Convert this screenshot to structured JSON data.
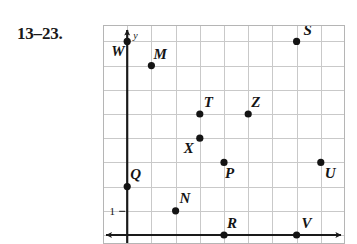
{
  "exercise": {
    "label": "13–23."
  },
  "figure": {
    "axis_labels": {
      "y": "y"
    },
    "tick_labels": {
      "one": "1"
    },
    "colors": {
      "grid_line": "#c9c9c9",
      "axis": "#1a1a1a",
      "point": "#141414",
      "text": "#141414",
      "background": "#ffffff",
      "frame": "#b5b5b5"
    }
  },
  "chart_data": {
    "type": "scatter",
    "title": "",
    "xlabel": "",
    "ylabel": "y",
    "xlim": [
      -1,
      9
    ],
    "ylim": [
      0,
      9
    ],
    "grid": true,
    "legend": "none",
    "tick_labels": {
      "y": [
        "1"
      ]
    },
    "points": [
      {
        "name": "W",
        "x": 0,
        "y": 8,
        "label_dx": -16,
        "label_dy": 15
      },
      {
        "name": "S",
        "x": 7,
        "y": 8,
        "label_dx": 7,
        "label_dy": -6
      },
      {
        "name": "M",
        "x": 1,
        "y": 7,
        "label_dx": 2,
        "label_dy": -7
      },
      {
        "name": "T",
        "x": 3,
        "y": 5,
        "label_dx": 4,
        "label_dy": -7
      },
      {
        "name": "Z",
        "x": 5,
        "y": 5,
        "label_dx": 3,
        "label_dy": -7
      },
      {
        "name": "X",
        "x": 3,
        "y": 4,
        "label_dx": -16,
        "label_dy": 15
      },
      {
        "name": "P",
        "x": 4,
        "y": 3,
        "label_dx": 1,
        "label_dy": 16
      },
      {
        "name": "U",
        "x": 8,
        "y": 3,
        "label_dx": 4,
        "label_dy": 16
      },
      {
        "name": "Q",
        "x": 0,
        "y": 2,
        "label_dx": 3,
        "label_dy": -8
      },
      {
        "name": "N",
        "x": 2,
        "y": 1,
        "label_dx": 4,
        "label_dy": -8
      },
      {
        "name": "R",
        "x": 4,
        "y": 0,
        "label_dx": 3,
        "label_dy": -7
      },
      {
        "name": "V",
        "x": 7,
        "y": 0,
        "label_dx": 5,
        "label_dy": -7
      }
    ]
  }
}
